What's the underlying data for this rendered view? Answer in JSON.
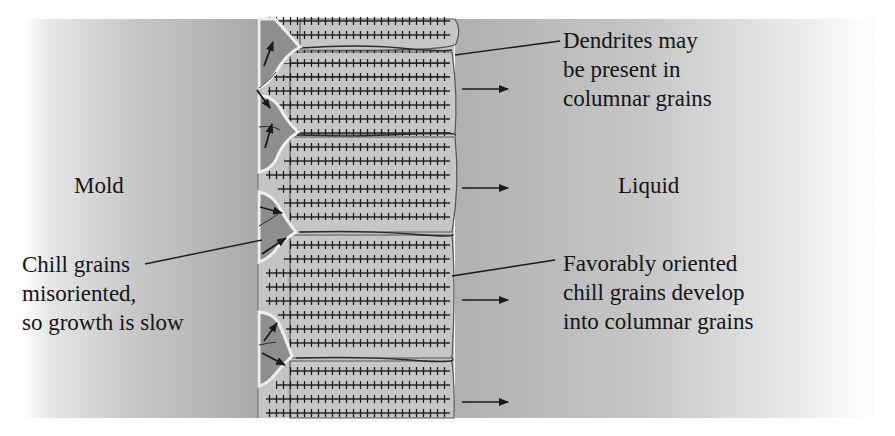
{
  "diagram": {
    "title": "",
    "regions": {
      "mold_label": "Mold",
      "liquid_label": "Liquid"
    },
    "callouts": {
      "dendrites": {
        "lines": [
          "Dendrites may",
          "be present in",
          "columnar grains"
        ]
      },
      "chill_grains": {
        "lines": [
          "Chill grains",
          "misoriented,",
          "so growth is slow"
        ]
      },
      "favorable": {
        "lines": [
          "Favorably oriented",
          "chill grains develop",
          "into columnar grains"
        ]
      }
    },
    "growth_arrows_count": 4,
    "chill_grain_arrows_count": 7,
    "colors": {
      "mold_gray": "#a8a8a8",
      "liquid_gray": "#b4b4b4",
      "columnar_grain": "#c6c6c6",
      "chill_grain": "#8e8e8e",
      "boundary_highlight": "#eeeeee",
      "ink": "#1a1a1a"
    }
  }
}
